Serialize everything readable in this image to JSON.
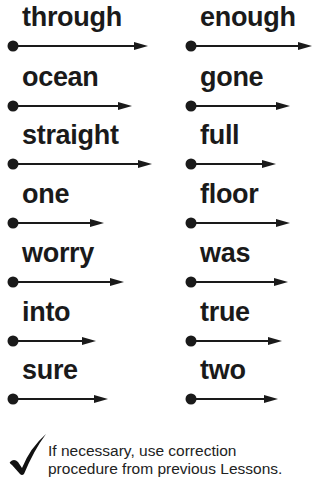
{
  "columns": [
    {
      "words": [
        {
          "text": "through",
          "arrow_len": 138
        },
        {
          "text": "ocean",
          "arrow_len": 122
        },
        {
          "text": "straight",
          "arrow_len": 142
        },
        {
          "text": "one",
          "arrow_len": 94
        },
        {
          "text": "worry",
          "arrow_len": 114
        },
        {
          "text": "into",
          "arrow_len": 86
        },
        {
          "text": "sure",
          "arrow_len": 98
        }
      ]
    },
    {
      "words": [
        {
          "text": "enough",
          "arrow_len": 124
        },
        {
          "text": "gone",
          "arrow_len": 102
        },
        {
          "text": "full",
          "arrow_len": 88
        },
        {
          "text": "floor",
          "arrow_len": 102
        },
        {
          "text": "was",
          "arrow_len": 100
        },
        {
          "text": "true",
          "arrow_len": 94
        },
        {
          "text": "two",
          "arrow_len": 90
        }
      ]
    }
  ],
  "note": {
    "line1": "If necessary, use correction",
    "line2": "procedure from previous Lessons."
  }
}
